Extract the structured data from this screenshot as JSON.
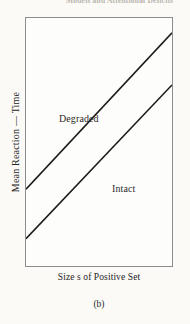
{
  "figure": {
    "caption": "(b)",
    "top_bleed_text": "Models and Attentional Deficits",
    "background_color": "#fbfaf7",
    "frame_color": "#8d8d8d",
    "line_color": "#1a1a1a",
    "text_color": "#242424"
  },
  "chart_data": {
    "type": "line",
    "title": "",
    "subtitle": "",
    "xlabel": "Size s of Positive Set",
    "ylabel": "Mean Reaction — Time",
    "xlim": [
      0,
      100
    ],
    "ylim": [
      0,
      100
    ],
    "grid": false,
    "axis_ticks": false,
    "legend": "inline-annotations",
    "legend_position": "inside-plot",
    "x": [
      0,
      100
    ],
    "series": [
      {
        "name": "Degraded",
        "values": [
          31,
          94
        ],
        "label_x": 22,
        "label_y": 62,
        "stroke_width": 1.6
      },
      {
        "name": "Intact",
        "values": [
          11,
          73
        ],
        "label_x": 58,
        "label_y": 34,
        "stroke_width": 1.6
      }
    ],
    "annotations": [
      {
        "text": "Degraded",
        "x": 22,
        "y": 62
      },
      {
        "text": "Intact",
        "x": 58,
        "y": 34
      }
    ]
  }
}
